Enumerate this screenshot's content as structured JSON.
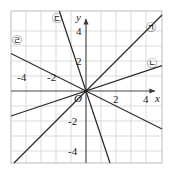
{
  "figure": {
    "kind": "coordinate-plane-line-graph",
    "width": 172,
    "height": 178,
    "background": "#ffffff",
    "frame_color": "#b8b8b8",
    "grid_color": "#cfcfcf",
    "axis_color": "#4a4a4a",
    "line_color": "#2b2b2b",
    "origin_label": "O",
    "x_axis_name": "x",
    "y_axis_name": "y"
  },
  "chart_data": {
    "type": "line",
    "title": "",
    "subtitle": "",
    "xlabel": "x",
    "ylabel": "y",
    "xlim": [
      -5,
      5
    ],
    "ylim": [
      -5,
      5
    ],
    "grid": true,
    "grid_step": 1,
    "legend_position": "inline-endpoint-labels",
    "x_tick_labels": [
      "-4",
      "-2",
      "2",
      "4"
    ],
    "x_tick_values": [
      -4,
      -2,
      2,
      4
    ],
    "y_tick_labels": [
      "4",
      "2",
      "-2",
      "-4"
    ],
    "y_tick_values": [
      4,
      2,
      -2,
      -4
    ],
    "origin_marked": true,
    "all_lines_through_origin": true,
    "series": [
      {
        "name": "㉠",
        "label": "㉠",
        "equation": "y = x",
        "slope": 1,
        "intercept": 0,
        "label_position": "upper-right"
      },
      {
        "name": "㉡",
        "label": "㉡",
        "equation": "y = x/3",
        "slope": 0.3333,
        "intercept": 0,
        "label_position": "right"
      },
      {
        "name": "㉢",
        "label": "㉢",
        "equation": "y = -3x",
        "slope": -3,
        "intercept": 0,
        "label_position": "upper-left-of-y-axis"
      },
      {
        "name": "㉣",
        "label": "㉣",
        "equation": "y = -x/2",
        "slope": -0.5,
        "intercept": 0,
        "label_position": "upper-left"
      }
    ]
  },
  "labels": {
    "x_neg4": "-4",
    "x_neg2": "-2",
    "x_pos2": "2",
    "x_pos4": "4",
    "y_pos4": "4",
    "y_pos2": "2",
    "y_neg2": "-2",
    "y_neg4": "-4",
    "origin": "O",
    "x_axis": "x",
    "y_axis": "y",
    "curve_a": "㉠",
    "curve_b": "㉡",
    "curve_c": "㉢",
    "curve_d": "㉣"
  }
}
